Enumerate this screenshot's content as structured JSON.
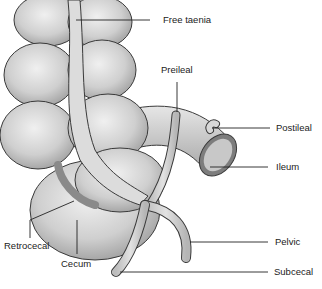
{
  "diagram": {
    "colors": {
      "organ_fill": "#d4d4d4",
      "organ_shadow": "#a8a8a8",
      "outline": "#3a3a3a",
      "leader": "#222222",
      "text": "#222222"
    },
    "labels": [
      {
        "id": "free-taenia",
        "text": "Free taenia",
        "x": 163,
        "y": 17
      },
      {
        "id": "preileal",
        "text": "Preileal",
        "x": 161,
        "y": 67
      },
      {
        "id": "postileal",
        "text": "Postileal",
        "x": 276,
        "y": 124
      },
      {
        "id": "ileum",
        "text": "Ileum",
        "x": 276,
        "y": 163
      },
      {
        "id": "retrocecal",
        "text": "Retrocecal",
        "x": 4,
        "y": 241
      },
      {
        "id": "cecum",
        "text": "Cecum",
        "x": 61,
        "y": 259
      },
      {
        "id": "pelvic",
        "text": "Pelvic",
        "x": 275,
        "y": 238
      },
      {
        "id": "subcecal",
        "text": "Subcecal",
        "x": 274,
        "y": 268
      }
    ]
  }
}
